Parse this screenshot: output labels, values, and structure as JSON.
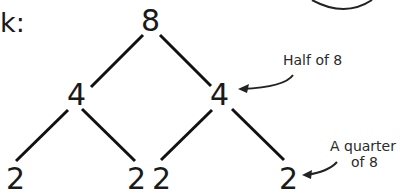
{
  "intro_text": "k:",
  "tree": {
    "root": "8",
    "level1": [
      "4",
      "4"
    ],
    "level2": [
      "2",
      "2",
      "2",
      "2"
    ]
  },
  "annotations": {
    "half": "Half of 8",
    "quarter_line1": "A quarter",
    "quarter_line2": "of 8"
  },
  "colors": {
    "ink": "#1a1a1a",
    "background": "#ffffff"
  }
}
